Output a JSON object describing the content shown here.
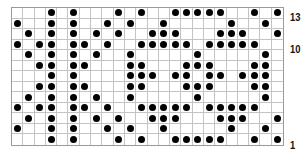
{
  "chart": {
    "columns": 24,
    "rows": 13,
    "row_labels": [
      {
        "row": 13,
        "text": "13"
      },
      {
        "row": 10,
        "text": "10"
      },
      {
        "row": 1,
        "text": "1"
      }
    ],
    "dot_color": "#000000",
    "grid_color": "#c4c4c4",
    "pattern": {
      "13": [
        4,
        6,
        10,
        12,
        15,
        16,
        17,
        18,
        19,
        22,
        24
      ],
      "12": [
        1,
        4,
        6,
        9,
        11,
        14,
        20,
        23
      ],
      "11": [
        2,
        4,
        6,
        8,
        10,
        13,
        14,
        15,
        19,
        20,
        21,
        24
      ],
      "10": [
        1,
        3,
        4,
        6,
        7,
        9,
        12,
        13,
        14,
        15,
        16,
        18,
        19,
        20,
        21,
        22
      ],
      "9": [
        2,
        4,
        6,
        8,
        11,
        17,
        23
      ],
      "8": [
        3,
        4,
        6,
        7,
        11,
        12,
        16,
        17,
        18,
        22,
        23
      ],
      "7": [
        4,
        6,
        11,
        12,
        13,
        15,
        16,
        18,
        19,
        21,
        22,
        23
      ],
      "6": [
        3,
        4,
        6,
        7,
        11,
        12,
        16,
        17,
        18,
        22,
        23
      ],
      "5": [
        2,
        4,
        6,
        8,
        11,
        17,
        23
      ],
      "4": [
        1,
        3,
        4,
        6,
        7,
        9,
        12,
        13,
        14,
        15,
        16,
        18,
        19,
        20,
        21,
        22
      ],
      "3": [
        2,
        4,
        6,
        8,
        10,
        13,
        14,
        15,
        19,
        20,
        21,
        24
      ],
      "2": [
        1,
        4,
        6,
        9,
        11,
        14,
        20,
        23
      ],
      "1": [
        4,
        6,
        10,
        12,
        15,
        16,
        17,
        18,
        19,
        22,
        24
      ]
    }
  }
}
